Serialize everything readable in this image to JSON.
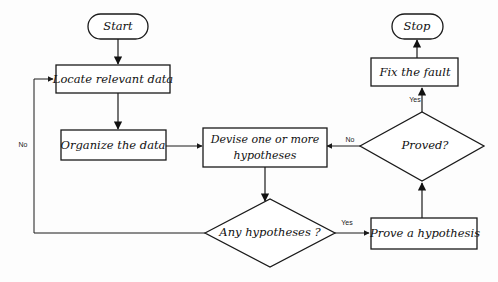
{
  "diagram": {
    "background_color": "#fdfdfd",
    "line_color": "#1a1a1a",
    "shape_fill": "#ffffff",
    "nodes": [
      {
        "id": "start",
        "label": "Start",
        "shape": "terminator"
      },
      {
        "id": "locate",
        "label": "Locate relevant data",
        "shape": "process"
      },
      {
        "id": "organize",
        "label": "Organize the data",
        "shape": "process"
      },
      {
        "id": "devise1",
        "label": "Devise one or more",
        "shape": "process"
      },
      {
        "id": "devise2",
        "label": "hypotheses",
        "shape": "process"
      },
      {
        "id": "any",
        "label": "Any hypotheses ?",
        "shape": "decision"
      },
      {
        "id": "prove",
        "label": "Prove a hypothesis",
        "shape": "process"
      },
      {
        "id": "proved",
        "label": "Proved?",
        "shape": "decision"
      },
      {
        "id": "fix",
        "label": "Fix the fault",
        "shape": "process"
      },
      {
        "id": "stop",
        "label": "Stop",
        "shape": "terminator"
      }
    ],
    "edge_labels": {
      "any_no": "No",
      "any_yes": "Yes",
      "proved_no": "No",
      "proved_yes": "Yes"
    }
  }
}
